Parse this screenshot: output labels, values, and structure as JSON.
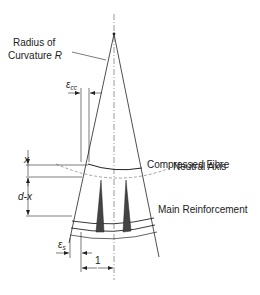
{
  "diagram": {
    "title": "",
    "labels": {
      "radius_line1": "Radius of",
      "radius_line2": "Curvature ",
      "radius_symbol": "R",
      "compressed_fibre": "Compressed Fibre",
      "neutral_axis": "Neutral Axis",
      "main_reinforcement": "Main Reinforcement",
      "x_dim": "x",
      "d_minus_x_dim": "d-x",
      "epsilon_cc_symbol": "ε",
      "epsilon_cc_sub": "cc",
      "epsilon_s_symbol": "ε",
      "epsilon_s_sub": "s",
      "unit_length": "1"
    },
    "colors": {
      "line": "#222222",
      "hatch": "#555555",
      "background": "#ffffff"
    }
  }
}
